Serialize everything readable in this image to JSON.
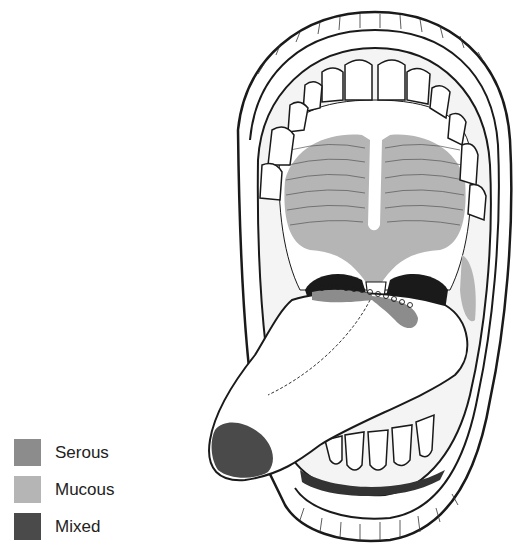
{
  "figure": {
    "regions": [
      {
        "name": "palate-glands",
        "type": "Mucous"
      },
      {
        "name": "tongue-posterior-glands",
        "type": "Serous"
      },
      {
        "name": "tongue-tip-glands",
        "type": "Mixed"
      },
      {
        "name": "cheek-glands",
        "type": "Mucous"
      }
    ]
  },
  "legend": {
    "items": [
      {
        "label": "Serous",
        "color": "#8c8c8c"
      },
      {
        "label": "Mucous",
        "color": "#b5b5b5"
      },
      {
        "label": "Mixed",
        "color": "#4a4a4a"
      }
    ]
  },
  "colors": {
    "serous": "#8c8c8c",
    "mucous": "#b5b5b5",
    "mixed": "#4a4a4a",
    "outline": "#1a1a1a",
    "background": "#ffffff"
  }
}
